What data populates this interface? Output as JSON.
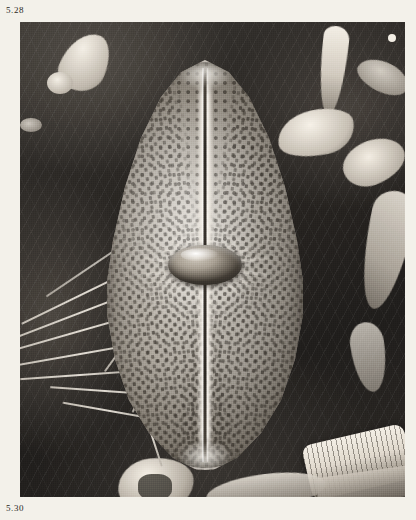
{
  "plate": {
    "figure_label_top": "5.28",
    "figure_label_bottom": "5.30",
    "paper_color": "#f3f1ea",
    "ink_color": "#2b2824",
    "image_type": "scanning electron micrograph",
    "subject": "diatom valve",
    "background_color": "#2b2825",
    "specimen_highlight_color": "#e8e3da"
  },
  "specimen": {
    "outline": "lanceolate-elliptical valve",
    "features": {
      "raphe": "axial raphe slit",
      "central_nodule": "central nodule",
      "striae": "radiating striae of areolae",
      "apices": "rounded apices"
    }
  },
  "background_objects": {
    "debris": "mineral and frustule debris fragments",
    "fibres": "fibrous needle-like filaments",
    "girdle_band": "striated girdle band fragment"
  }
}
